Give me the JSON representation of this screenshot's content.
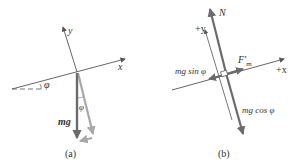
{
  "panel_a": {
    "caption": "(a)",
    "axis_x_label": "x",
    "axis_y_label": "y",
    "angle_label_horizontal": "φ",
    "angle_label_vertical": "φ",
    "weight_label": "mg⃗"
  },
  "panel_b": {
    "caption": "(b)",
    "normal_label": "N",
    "axis_y_label": "+y",
    "axis_x_label": "+x",
    "force_label": "F′",
    "force_subscript": "m",
    "parallel_component_label": "mg sin φ",
    "perpendicular_component_label": "mg cos φ"
  },
  "colors": {
    "axis": "#555555",
    "vector_dark": "#6b6b6b",
    "vector_light": "#a8a8a8",
    "text": "#333333"
  }
}
